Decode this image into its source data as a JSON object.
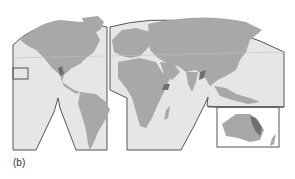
{
  "figure": {
    "caption": "(b)",
    "projection": "interrupted world map (Goode-like lobes)",
    "colors": {
      "ocean": "#e6e6e6",
      "land": "#a8a8a8",
      "highlight": "#6f6f6f",
      "outline": "#555555",
      "background": "#ffffff"
    },
    "insets": [
      {
        "name": "hawaii-inset"
      },
      {
        "name": "southeast-asia-inset"
      },
      {
        "name": "australia-inset"
      }
    ],
    "highlighted_regions": [
      "mexico-highlight",
      "east-africa-rift-highlight",
      "tibet-highlight",
      "eastern-australia-highlight"
    ]
  }
}
